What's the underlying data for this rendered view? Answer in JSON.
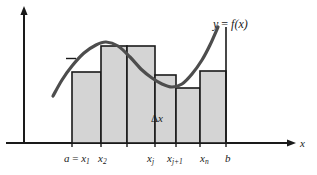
{
  "figure": {
    "background_color": "#ffffff",
    "bar_fill_color": "#d4d4d4",
    "bar_stroke_color": "#1a1a1a",
    "curve_color": "#4d4d4d",
    "axis_color": "#1a1a1a"
  },
  "labels": {
    "curve": {
      "y": "y",
      "equals": "=",
      "fx": "f(x)"
    },
    "delta_x": {
      "delta": "Δ",
      "x": "x"
    },
    "x_axis": "x"
  },
  "ticks": [
    {
      "name": "a-equals-x1",
      "text_a": "a",
      "op": "=",
      "var": "x",
      "sub": "1",
      "x": 64,
      "y": 153
    },
    {
      "name": "x2",
      "text_a": "",
      "op": "",
      "var": "x",
      "sub": "2",
      "x": 98,
      "y": 153
    },
    {
      "name": "xj",
      "text_a": "",
      "op": "",
      "var": "x",
      "sub": "j",
      "x": 147,
      "y": 153
    },
    {
      "name": "xj-plus-1",
      "text_a": "",
      "op": "",
      "var": "x",
      "sub": "j+1",
      "x": 167,
      "y": 153
    },
    {
      "name": "xn",
      "text_a": "",
      "op": "",
      "var": "x",
      "sub": "n",
      "x": 200,
      "y": 153
    },
    {
      "name": "b",
      "text_a": "b",
      "op": "",
      "var": "",
      "sub": "",
      "x": 225,
      "y": 153
    }
  ],
  "chart_data": {
    "type": "bar",
    "xlabel": "x",
    "ylabel": "",
    "baseline_y": 143,
    "y_axis_x": 24,
    "x_axis_arrow_x": 295,
    "bars": [
      {
        "label": "rect-1",
        "x_left": 72,
        "x_right": 101,
        "top": 72
      },
      {
        "label": "rect-2",
        "x_left": 101,
        "x_right": 127,
        "top": 46
      },
      {
        "label": "rect-3",
        "x_left": 127,
        "x_right": 155,
        "top": 46
      },
      {
        "label": "rect-4",
        "x_left": 155,
        "x_right": 176,
        "top": 75
      },
      {
        "label": "rect-5",
        "x_left": 176,
        "x_right": 200,
        "top": 88
      },
      {
        "label": "rect-6",
        "x_left": 200,
        "x_right": 226,
        "top": 71
      }
    ],
    "curve_points": [
      [
        53,
        96
      ],
      [
        62,
        80
      ],
      [
        72,
        66
      ],
      [
        84,
        53
      ],
      [
        96,
        45
      ],
      [
        106,
        42
      ],
      [
        118,
        46
      ],
      [
        130,
        57
      ],
      [
        142,
        70
      ],
      [
        152,
        78
      ],
      [
        162,
        84
      ],
      [
        172,
        87
      ],
      [
        182,
        84
      ],
      [
        192,
        74
      ],
      [
        202,
        60
      ],
      [
        210,
        45
      ],
      [
        218,
        27
      ]
    ],
    "curve_end_vertical": {
      "x": 226,
      "y_top": 27,
      "y_bottom": 143
    }
  }
}
